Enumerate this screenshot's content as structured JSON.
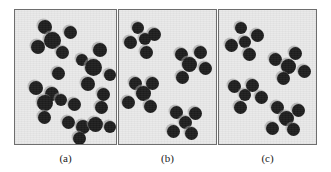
{
  "figure": {
    "background_color": "#ffffff",
    "panel_fill_color": "#e9e9e9",
    "panel_border_color": "#6e6e6e",
    "dot_color": "#1d1d1d",
    "dot_halo_color": "#969696"
  },
  "panels": [
    {
      "id": "a",
      "caption": "(a)",
      "x": 14,
      "y": 9,
      "width": 103,
      "height": 136,
      "dot_count": 24,
      "pattern": "random",
      "dots": [
        {
          "cx": 30,
          "cy": 17,
          "r": 7.0
        },
        {
          "cx": 55,
          "cy": 22,
          "r": 6.5
        },
        {
          "cx": 37,
          "cy": 30,
          "r": 8.5
        },
        {
          "cx": 23,
          "cy": 37,
          "r": 7.0
        },
        {
          "cx": 47,
          "cy": 42,
          "r": 6.5
        },
        {
          "cx": 85,
          "cy": 40,
          "r": 7.0
        },
        {
          "cx": 67,
          "cy": 50,
          "r": 6.0
        },
        {
          "cx": 78,
          "cy": 57,
          "r": 8.5
        },
        {
          "cx": 95,
          "cy": 65,
          "r": 6.0
        },
        {
          "cx": 43,
          "cy": 63,
          "r": 6.5
        },
        {
          "cx": 73,
          "cy": 74,
          "r": 7.0
        },
        {
          "cx": 21,
          "cy": 78,
          "r": 7.0
        },
        {
          "cx": 37,
          "cy": 84,
          "r": 7.0
        },
        {
          "cx": 30,
          "cy": 93,
          "r": 8.0
        },
        {
          "cx": 46,
          "cy": 90,
          "r": 6.0
        },
        {
          "cx": 59,
          "cy": 94,
          "r": 6.5
        },
        {
          "cx": 29,
          "cy": 107,
          "r": 6.5
        },
        {
          "cx": 86,
          "cy": 97,
          "r": 6.5
        },
        {
          "cx": 53,
          "cy": 112,
          "r": 6.5
        },
        {
          "cx": 68,
          "cy": 117,
          "r": 7.0
        },
        {
          "cx": 80,
          "cy": 114,
          "r": 7.5
        },
        {
          "cx": 95,
          "cy": 117,
          "r": 6.0
        },
        {
          "cx": 64,
          "cy": 128,
          "r": 6.5
        },
        {
          "cx": 88,
          "cy": 84,
          "r": 6.5
        }
      ]
    },
    {
      "id": "b",
      "caption": "(b)",
      "x": 118,
      "y": 9,
      "width": 99,
      "height": 136,
      "dot_count": 20,
      "pattern": "clustered",
      "clusters": 4,
      "dots": [
        {
          "cx": 19,
          "cy": 18,
          "r": 6.0
        },
        {
          "cx": 35,
          "cy": 24,
          "r": 6.5
        },
        {
          "cx": 26,
          "cy": 29,
          "r": 6.0
        },
        {
          "cx": 11,
          "cy": 32,
          "r": 6.5
        },
        {
          "cx": 27,
          "cy": 42,
          "r": 6.5
        },
        {
          "cx": 62,
          "cy": 44,
          "r": 6.5
        },
        {
          "cx": 81,
          "cy": 42,
          "r": 6.5
        },
        {
          "cx": 70,
          "cy": 54,
          "r": 7.5
        },
        {
          "cx": 86,
          "cy": 58,
          "r": 6.5
        },
        {
          "cx": 63,
          "cy": 67,
          "r": 6.5
        },
        {
          "cx": 16,
          "cy": 73,
          "r": 6.5
        },
        {
          "cx": 33,
          "cy": 73,
          "r": 6.5
        },
        {
          "cx": 24,
          "cy": 83,
          "r": 7.5
        },
        {
          "cx": 9,
          "cy": 92,
          "r": 6.5
        },
        {
          "cx": 31,
          "cy": 96,
          "r": 6.5
        },
        {
          "cx": 57,
          "cy": 102,
          "r": 6.5
        },
        {
          "cx": 76,
          "cy": 103,
          "r": 6.5
        },
        {
          "cx": 66,
          "cy": 112,
          "r": 6.5
        },
        {
          "cx": 54,
          "cy": 121,
          "r": 6.5
        },
        {
          "cx": 72,
          "cy": 123,
          "r": 6.5
        }
      ]
    },
    {
      "id": "c",
      "caption": "(c)",
      "x": 218,
      "y": 9,
      "width": 99,
      "height": 136,
      "dot_count": 20,
      "pattern": "regular",
      "clusters": 4,
      "dots": [
        {
          "cx": 22,
          "cy": 18,
          "r": 6.0
        },
        {
          "cx": 38,
          "cy": 25,
          "r": 6.5
        },
        {
          "cx": 26,
          "cy": 32,
          "r": 6.0
        },
        {
          "cx": 12,
          "cy": 35,
          "r": 6.5
        },
        {
          "cx": 30,
          "cy": 44,
          "r": 6.5
        },
        {
          "cx": 56,
          "cy": 49,
          "r": 6.5
        },
        {
          "cx": 76,
          "cy": 43,
          "r": 6.5
        },
        {
          "cx": 69,
          "cy": 56,
          "r": 7.5
        },
        {
          "cx": 85,
          "cy": 61,
          "r": 6.5
        },
        {
          "cx": 64,
          "cy": 68,
          "r": 6.5
        },
        {
          "cx": 15,
          "cy": 76,
          "r": 6.5
        },
        {
          "cx": 33,
          "cy": 75,
          "r": 6.5
        },
        {
          "cx": 26,
          "cy": 85,
          "r": 6.0
        },
        {
          "cx": 42,
          "cy": 87,
          "r": 6.5
        },
        {
          "cx": 21,
          "cy": 97,
          "r": 6.5
        },
        {
          "cx": 58,
          "cy": 97,
          "r": 6.5
        },
        {
          "cx": 79,
          "cy": 100,
          "r": 6.5
        },
        {
          "cx": 67,
          "cy": 108,
          "r": 7.5
        },
        {
          "cx": 53,
          "cy": 118,
          "r": 6.5
        },
        {
          "cx": 74,
          "cy": 119,
          "r": 6.5
        }
      ]
    }
  ]
}
